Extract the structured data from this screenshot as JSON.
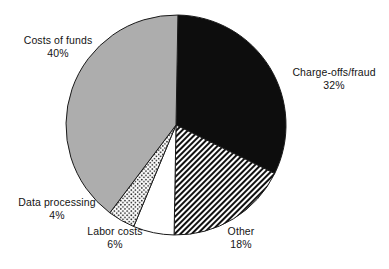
{
  "chart_data": {
    "type": "pie",
    "title": "",
    "subtitle": "",
    "xlabel": "",
    "ylabel": "",
    "legend_position": "none",
    "grid": false,
    "units": "percent",
    "total": 100,
    "start_angle_deg": 1,
    "direction": "clockwise",
    "categories": [
      "Charge-offs/fraud",
      "Other",
      "Labor costs",
      "Data processing",
      "Costs of funds"
    ],
    "values": [
      32,
      18,
      6,
      4,
      40
    ],
    "slices": [
      {
        "label": "Charge-offs/fraud",
        "value": 32,
        "value_text": "32%",
        "fill_style": "solid-black",
        "color": "#0d0d0d",
        "start_angle_deg": 1,
        "end_angle_deg": 116.2
      },
      {
        "label": "Other",
        "value": 18,
        "value_text": "18%",
        "fill_style": "diagonal-hatch",
        "color": "#111111",
        "start_angle_deg": 116.2,
        "end_angle_deg": 181
      },
      {
        "label": "Labor costs",
        "value": 6,
        "value_text": "6%",
        "fill_style": "white",
        "color": "#ffffff",
        "start_angle_deg": 181,
        "end_angle_deg": 202.6
      },
      {
        "label": "Data processing",
        "value": 4,
        "value_text": "4%",
        "fill_style": "dotted",
        "color": "#ffffff",
        "start_angle_deg": 202.6,
        "end_angle_deg": 217
      },
      {
        "label": "Costs of funds",
        "value": 40,
        "value_text": "40%",
        "fill_style": "solid-gray",
        "color": "#adadad",
        "start_angle_deg": 217,
        "end_angle_deg": 361
      }
    ]
  },
  "labels": {
    "costs_of_funds": {
      "name": "Costs of funds",
      "pct": "40%"
    },
    "charge_offs_fraud": {
      "name": "Charge-offs/fraud",
      "pct": "32%"
    },
    "data_processing": {
      "name": "Data processing",
      "pct": "4%"
    },
    "labor_costs": {
      "name": "Labor costs",
      "pct": "6%"
    },
    "other": {
      "name": "Other",
      "pct": "18%"
    }
  },
  "colors": {
    "background": "#ffffff",
    "outline": "#1a1a1a",
    "gray_slice": "#adadad",
    "black_slice": "#0d0d0d",
    "text": "#141414"
  }
}
